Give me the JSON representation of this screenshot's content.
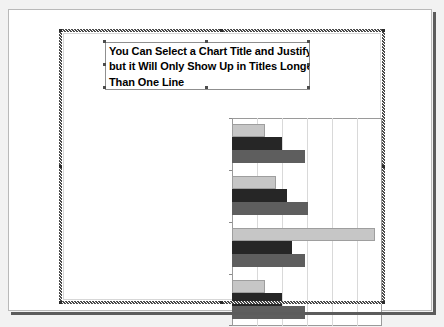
{
  "app": {
    "surface": "presentation-slide",
    "selected_object": "embedded-bar-chart"
  },
  "chart_title": {
    "text": "You Can Select a Chart Title and Justify It but it Will Only Show Up in Titles Longer Than One Line",
    "line1": "You Can Select a Chart Title and Justify It",
    "line2": "but it Will Only Show Up in Titles Longer",
    "line3": "Than One Line",
    "clipped": "true",
    "bold": "true"
  },
  "colors": {
    "series1": "#c6c6c6",
    "series2": "#262626",
    "series3": "#5e5e5e",
    "plot_border": "#9a9a9a",
    "gridline": "#d9d9d9",
    "slide_background": "#ffffff",
    "slide_border": "#b9b9b9",
    "selection_hatch": "#4a4a4a"
  },
  "chart_data": {
    "type": "bar",
    "orientation": "horizontal",
    "xlabel": "",
    "ylabel": "",
    "xlim": [
      0,
      6
    ],
    "grid": true,
    "gridlines_x": [
      1,
      2,
      3,
      4,
      5
    ],
    "legend": "none",
    "categories": [
      "X-Axis Label Can Sometimes Be Very Long and They're Centered -- but Each Axis Is Centered Based on Its Text",
      "The Axes Aren't Centered Relative to Each Other",
      "They're Each Centered Relative to the Text Included in That Axis Label",
      "Unfortunately, There's No Way to Specify Left- or Right-Justification of Axis Label Text"
    ],
    "category_label_lines": [
      [
        "X-Axis Label Can Sometimes Be",
        "Very Long and They're Centered",
        "-- but Each Axis Is Centered",
        "Based on Its Text"
      ],
      [
        "The Axes Aren't Centered",
        "Relative to Each Other"
      ],
      [
        "They're Each Centered Relative",
        "to the Text Included in That Axis",
        "Label"
      ],
      [
        "Unfortunately, There's No Way to",
        "Specify Left- or Right-",
        "Justification of Axis Label Text"
      ]
    ],
    "series": [
      {
        "name": "Series 1",
        "color": "#c6c6c6",
        "values": [
          1.3,
          1.75,
          5.7,
          1.3
        ]
      },
      {
        "name": "Series 2",
        "color": "#262626",
        "values": [
          2.0,
          2.2,
          2.4,
          2.0
        ]
      },
      {
        "name": "Series 3",
        "color": "#5e5e5e",
        "values": [
          2.9,
          3.05,
          2.9,
          2.9
        ]
      }
    ]
  }
}
